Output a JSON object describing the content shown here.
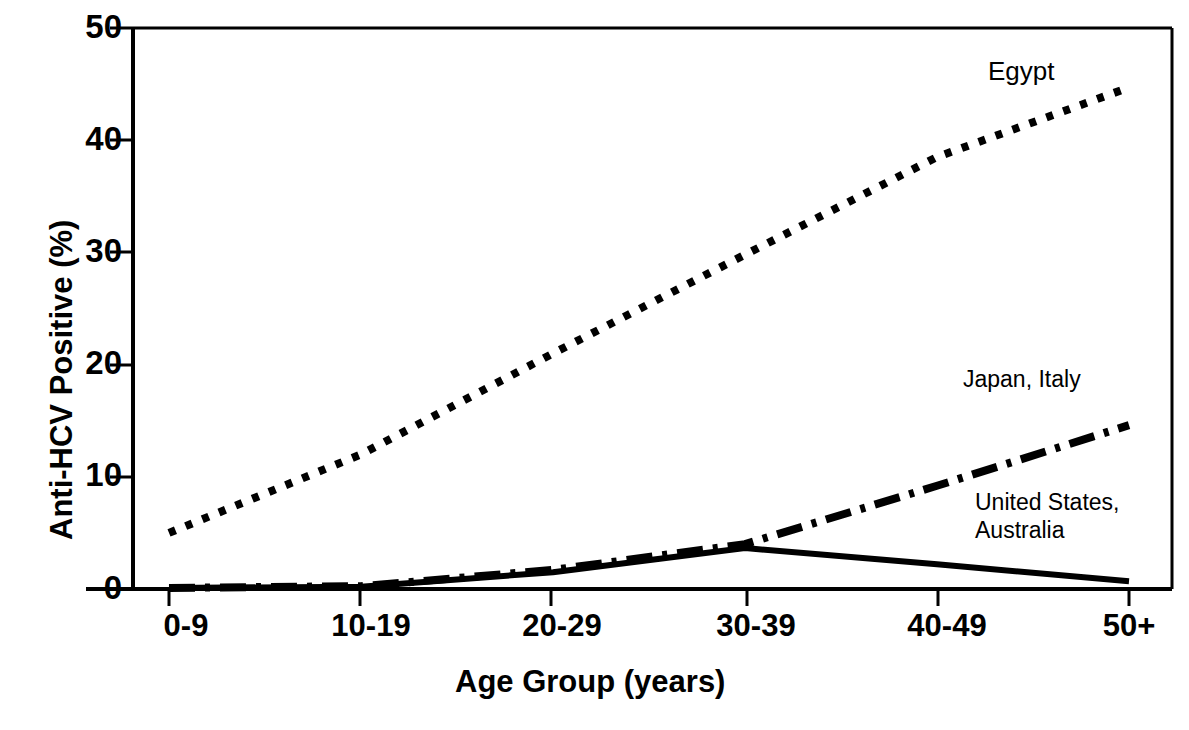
{
  "chart_data": {
    "type": "line",
    "title": "",
    "xlabel": "Age Group (years)",
    "ylabel": "Anti-HCV Positive (%)",
    "categories": [
      "0-9",
      "10-19",
      "20-29",
      "30-39",
      "40-49",
      "50+"
    ],
    "ylim": [
      0,
      50
    ],
    "yticks": [
      0,
      10,
      20,
      30,
      40,
      50
    ],
    "ytick_labels": [
      "0",
      "10",
      "20",
      "30",
      "40",
      "50"
    ],
    "grid": false,
    "legend": "inline-annotations",
    "series": [
      {
        "name": "Egypt",
        "style": "dotted",
        "color": "#000000",
        "values": [
          5.0,
          12.0,
          21.0,
          29.8,
          38.5,
          44.7
        ],
        "label": "Egypt",
        "label_x_pct": 84.5,
        "label_y_pct": 8.6
      },
      {
        "name": "Japan, Italy",
        "style": "dash-dot",
        "color": "#000000",
        "values": [
          0.1,
          0.25,
          1.7,
          4.0,
          9.2,
          14.6
        ],
        "label": "Japan, Italy",
        "label_x_pct": 82.5,
        "label_y_pct": 49.5
      },
      {
        "name": "United States, Australia",
        "style": "solid",
        "color": "#000000",
        "values": [
          0.1,
          0.2,
          1.5,
          3.65,
          2.2,
          0.7
        ],
        "label": "United States,\nAustralia",
        "label_line1": "United States,",
        "label_line2": "Australia",
        "label_x_pct": 82.5,
        "label_y_pct": 67.0
      }
    ]
  },
  "axes": {
    "y_tick_labels": [
      "50",
      "40",
      "30",
      "20",
      "10",
      "0"
    ],
    "x_tick_labels": [
      "0-9",
      "10-19",
      "20-29",
      "30-39",
      "40-49",
      "50+"
    ],
    "x_title": "Age Group (years)",
    "y_title": "Anti-HCV Positive (%)"
  },
  "annotations": {
    "egypt": "Egypt",
    "japan_italy": "Japan, Italy",
    "united_states_line1": "United States,",
    "australia_line2": "Australia"
  },
  "colors": {
    "line": "#000000",
    "axis": "#000000",
    "background": "#ffffff"
  }
}
